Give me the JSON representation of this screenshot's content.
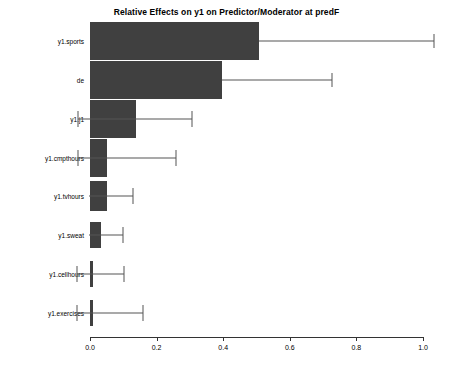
{
  "chart_data": {
    "type": "bar",
    "orientation": "horizontal",
    "title": "Relative Effects on y1 on Predictor/Moderator at predF",
    "xlabel": "",
    "ylabel": "",
    "grid": false,
    "legend": null,
    "xlim": [
      -0.04,
      1.05
    ],
    "xticks": [
      "0.0",
      "0.2",
      "0.4",
      "0.6",
      "0.8",
      "1.0"
    ],
    "xtick_values": [
      0.0,
      0.2,
      0.4,
      0.6,
      0.8,
      1.0
    ],
    "categories": [
      "y1.sports",
      "de",
      "y1.j1",
      "y1.cmpthours",
      "y1.tvhours",
      "y1.sweat",
      "y1.cellhours",
      "y1.exercises"
    ],
    "values": [
      0.508,
      0.396,
      0.138,
      0.05,
      0.051,
      0.033,
      0.01,
      0.001
    ],
    "error_low": [
      0.508,
      0.396,
      -0.036,
      -0.036,
      -0.003,
      -0.003,
      -0.04,
      -0.04
    ],
    "error_high": [
      1.033,
      0.727,
      0.306,
      0.258,
      0.13,
      0.098,
      0.102,
      0.159
    ],
    "bar_color": "#404040",
    "error_color": "#555555",
    "axis_color": "#333333",
    "background": "#ffffff"
  }
}
